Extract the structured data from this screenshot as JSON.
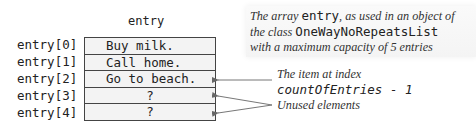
{
  "diagram": {
    "array_name": "entry",
    "rows": [
      {
        "index_label": "entry[0]",
        "value": "Buy milk."
      },
      {
        "index_label": "entry[1]",
        "value": "Call home."
      },
      {
        "index_label": "entry[2]",
        "value": "Go to beach."
      },
      {
        "index_label": "entry[3]",
        "value": "?"
      },
      {
        "index_label": "entry[4]",
        "value": "?"
      }
    ],
    "caption": {
      "part1": "The array ",
      "code1": "entry",
      "part2": ", as used in an object of",
      "part3": "the class ",
      "code2": "OneWayNoRepeatsList",
      "part4": "with a maximum capacity of 5 entries"
    },
    "annotations": {
      "last_item_text": "The item at index",
      "last_item_code": "countOfEntries - 1",
      "unused_text": "Unused elements"
    },
    "colors": {
      "cell_fill": "#f3f3f3",
      "border": "#444444",
      "arrow": "#666666"
    }
  }
}
